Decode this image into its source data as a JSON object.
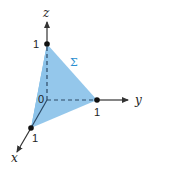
{
  "diagram": {
    "axes": {
      "x_label": "x",
      "y_label": "y",
      "z_label": "z"
    },
    "labels": {
      "origin": "0",
      "x_intercept": "1",
      "y_intercept": "1",
      "z_intercept": "1",
      "surface": "Σ"
    },
    "points": {
      "origin": [
        47,
        100
      ],
      "x1": [
        31,
        128
      ],
      "y1": [
        97,
        100
      ],
      "z1": [
        47,
        44
      ]
    },
    "colors": {
      "surface_fill": "#8ec4ea",
      "surface_left_face": "#6aaedd",
      "axis": "#333333",
      "sigma_label": "#2a8fd0"
    }
  }
}
